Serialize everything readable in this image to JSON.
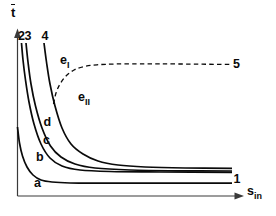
{
  "meta": {
    "background": "#ffffff",
    "ink": "#0a0a0a",
    "axis_color": "#3a3a3a"
  },
  "labels": {
    "y_axis": {
      "base": "t",
      "overbar": true
    },
    "x_axis": {
      "base": "s",
      "sub": "in"
    },
    "region_e1": {
      "base": "e",
      "sub": "I"
    },
    "region_e2": {
      "base": "e",
      "sub": "II"
    },
    "curve_a": "a",
    "curve_b": "b",
    "curve_c": "c",
    "curve_d": "d",
    "top_2": "2",
    "top_3": "3",
    "top_4": "4",
    "end_1": "1",
    "end_5": "5"
  },
  "chart_data": {
    "type": "line",
    "title": "",
    "xlabel": "s_in",
    "ylabel": "t̄",
    "axis_ticks": "none (qualitative sketch, unlabeled axes)",
    "legend": "curves labeled a, b, c, d on the lines; curve tops labeled 2, 3, 4; right endpoints labeled 1 and 5; regions labeled e_I (above dashed curve) and e_II (below dashed curve)",
    "coordinate_space": "screen pixels, origin top-left, y increases downward",
    "axes_px": {
      "y_axis": {
        "x": 17.5,
        "arrow_tip_y": 28.5,
        "bottom_y": 196
      },
      "x_axis": {
        "y": 196,
        "left_x": 17.5,
        "arrow_tip_x": 244
      }
    },
    "curves": [
      {
        "name": "a",
        "endpoint_label": "1",
        "style": "solid",
        "description": "lowest hyperbola-like decay starting on the y-axis, flattens to lowest asymptote",
        "points_px": [
          [
            17.5,
            127
          ],
          [
            19.5,
            143
          ],
          [
            22.5,
            156
          ],
          [
            27,
            167
          ],
          [
            33,
            175
          ],
          [
            41,
            180
          ],
          [
            52,
            182
          ],
          [
            70,
            183
          ],
          [
            100,
            183.2
          ],
          [
            160,
            183.2
          ],
          [
            232,
            183.2
          ]
        ]
      },
      {
        "name": "b",
        "start_label": "2",
        "style": "solid",
        "description": "steep decay from top of plot, labeled 2 at top and b on the lower limb",
        "points_px": [
          [
            21.5,
            43
          ],
          [
            23,
            60
          ],
          [
            25.5,
            80
          ],
          [
            29,
            102
          ],
          [
            34,
            124
          ],
          [
            41,
            144
          ],
          [
            50,
            158
          ],
          [
            62,
            166
          ],
          [
            80,
            170
          ],
          [
            110,
            171.5
          ],
          [
            160,
            172
          ],
          [
            232,
            172.3
          ]
        ]
      },
      {
        "name": "c",
        "start_label": "3",
        "style": "solid",
        "description": "steep decay just right of curve b, labeled 3 at top and c on the lower limb",
        "points_px": [
          [
            26,
            43
          ],
          [
            28,
            62
          ],
          [
            31,
            84
          ],
          [
            35.5,
            106
          ],
          [
            42,
            128
          ],
          [
            50.5,
            146
          ],
          [
            61,
            157
          ],
          [
            75,
            164
          ],
          [
            95,
            168
          ],
          [
            130,
            170
          ],
          [
            180,
            170.8
          ],
          [
            232,
            171
          ]
        ]
      },
      {
        "name": "d",
        "start_label": "4",
        "style": "solid",
        "description": "decay starting further right, labeled 4 at top and d on the lower limb",
        "points_px": [
          [
            44,
            43
          ],
          [
            46.5,
            62
          ],
          [
            50,
            84
          ],
          [
            55,
            106
          ],
          [
            62,
            128
          ],
          [
            71,
            144
          ],
          [
            83,
            154
          ],
          [
            98,
            161
          ],
          [
            118,
            165
          ],
          [
            145,
            167
          ],
          [
            185,
            168
          ],
          [
            232,
            168.3
          ]
        ]
      },
      {
        "name": "e",
        "endpoint_label": "5",
        "style": "dashed",
        "description": "dashed branch leaving curve d, sweeping up-right and flattening; separates regions e_I (above) and e_II (below)",
        "points_px": [
          [
            53.5,
            104
          ],
          [
            56,
            93
          ],
          [
            60,
            84
          ],
          [
            66,
            76
          ],
          [
            74,
            70
          ],
          [
            84,
            66.5
          ],
          [
            97,
            64.8
          ],
          [
            115,
            64
          ],
          [
            140,
            63.8
          ],
          [
            180,
            64
          ],
          [
            232,
            64.5
          ]
        ]
      }
    ]
  }
}
